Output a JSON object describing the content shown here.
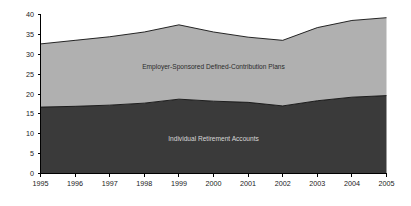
{
  "chart_data": {
    "type": "area",
    "stacked": true,
    "title": "",
    "subtitle": "",
    "xlabel": "",
    "ylabel": "",
    "categories": [
      "1995",
      "1996",
      "1997",
      "1998",
      "1999",
      "2000",
      "2001",
      "2002",
      "2003",
      "2004",
      "2005"
    ],
    "x": [
      1995,
      1996,
      1997,
      1998,
      1999,
      2000,
      2001,
      2002,
      2003,
      2004,
      2005
    ],
    "series": [
      {
        "name": "Individual Retirement Accounts",
        "order": "bottom",
        "color": "#3a3a3a",
        "values": [
          16.7,
          16.9,
          17.2,
          17.7,
          18.7,
          18.2,
          17.9,
          17.0,
          18.3,
          19.2,
          19.6
        ]
      },
      {
        "name": "Employer-Sponsored Defined-Contribution Plans",
        "order": "top",
        "color": "#b0b0b0",
        "values": [
          15.9,
          16.6,
          17.2,
          17.9,
          18.7,
          17.4,
          16.4,
          16.5,
          18.4,
          19.3,
          19.6
        ]
      }
    ],
    "cumulative_totals": [
      32.6,
      33.5,
      34.4,
      35.6,
      37.4,
      35.6,
      34.3,
      33.5,
      36.7,
      38.5,
      39.2
    ],
    "ylim": [
      0,
      40
    ],
    "yticks": [
      0,
      5,
      10,
      15,
      20,
      25,
      30,
      35,
      40
    ],
    "ytick_labels": [
      "0",
      "5",
      "10",
      "15",
      "20",
      "25",
      "30",
      "35",
      "40"
    ],
    "xtick_labels": [
      "1995",
      "1996",
      "1997",
      "1998",
      "1999",
      "2000",
      "2001",
      "2002",
      "2003",
      "2004",
      "2005"
    ],
    "grid": false,
    "legend": "inline-labels",
    "annotations": [
      {
        "text": "Employer-Sponsored Defined-Contribution Plans",
        "region": "upper-band"
      },
      {
        "text": "Individual Retirement Accounts",
        "region": "lower-band"
      }
    ]
  },
  "colors": {
    "upper_band": "#b0b0b0",
    "lower_band": "#3a3a3a",
    "axis": "#000000",
    "background": "#ffffff",
    "upper_label_text": "#2b2b2b",
    "lower_label_text": "#d8d8d8"
  },
  "labels": {
    "upper_band": "Employer-Sponsored Defined-Contribution Plans",
    "lower_band": "Individual Retirement Accounts"
  }
}
